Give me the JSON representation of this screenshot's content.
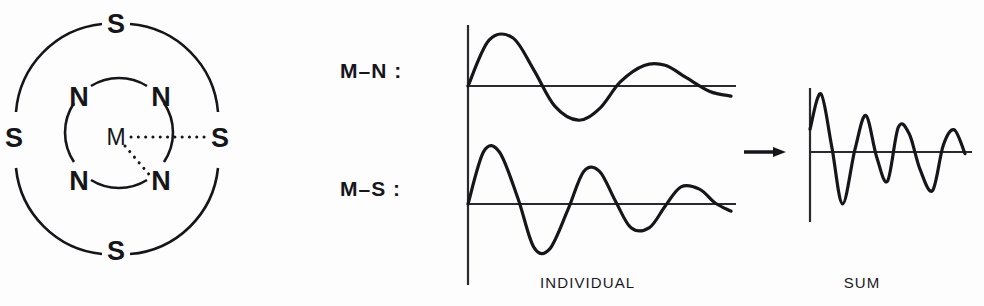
{
  "figure": {
    "background_color": "#fdfdfd",
    "ink_color": "#16161a"
  },
  "structure_diagram": {
    "name": "coordination-shell-diagram",
    "center_atom": "M",
    "inner_shell": {
      "element": "N",
      "count": 4,
      "labels": [
        "N",
        "N",
        "N",
        "N"
      ]
    },
    "outer_shell": {
      "element": "S",
      "count": 4,
      "labels": [
        "S",
        "S",
        "S",
        "S"
      ]
    },
    "bonds": [
      {
        "from": "M",
        "to": "S",
        "style": "dotted",
        "direction": "right"
      },
      {
        "from": "M",
        "to": "N",
        "style": "dotted",
        "direction": "lower-right"
      }
    ]
  },
  "wave_panel": {
    "row_labels": [
      "M–N :",
      "M–S :"
    ],
    "individual_caption": "INDIVIDUAL",
    "sum_caption": "SUM",
    "arrow_symbol": "→"
  },
  "chart_data": [
    {
      "type": "line",
      "name": "M-N",
      "title": "M–N :",
      "description": "Damped sinusoidal EXAFS contribution from the nitrogen shell",
      "frequency_cycles": 3,
      "xlabel": "",
      "ylabel": "",
      "grid": false,
      "legend": "none",
      "axis_x_px": 468,
      "baseline_y_px": 86,
      "x_start": 468,
      "x_end": 731,
      "amplitude_start": 56,
      "amplitude_end": 22,
      "x": [
        0,
        0.08,
        0.17,
        0.25,
        0.33,
        0.42,
        0.5,
        0.58,
        0.67,
        0.75,
        0.83,
        0.92,
        1.0
      ],
      "values": [
        0,
        0.86,
        0.96,
        0.34,
        -0.45,
        -0.82,
        -0.58,
        0.12,
        0.62,
        0.68,
        0.3,
        -0.22,
        -0.46
      ]
    },
    {
      "type": "line",
      "name": "M-S",
      "title": "M–S :",
      "description": "Damped sinusoidal EXAFS contribution from the sulfur shell, higher frequency",
      "frequency_cycles": 4,
      "xlabel": "",
      "ylabel": "",
      "grid": false,
      "legend": "none",
      "axis_x_px": 468,
      "baseline_y_px": 204,
      "x_start": 468,
      "x_end": 731,
      "amplitude_start": 62,
      "amplitude_end": 24,
      "x": [
        0,
        0.06,
        0.12,
        0.19,
        0.25,
        0.31,
        0.38,
        0.44,
        0.5,
        0.56,
        0.62,
        0.69,
        0.75,
        0.81,
        0.88,
        0.94,
        1.0
      ],
      "values": [
        0,
        0.88,
        0.9,
        0.1,
        -0.82,
        -0.9,
        -0.12,
        0.72,
        0.76,
        0.08,
        -0.62,
        -0.66,
        -0.06,
        0.55,
        0.52,
        0.04,
        -0.3
      ]
    },
    {
      "type": "line",
      "name": "SUM",
      "title": "SUM",
      "description": "Sum of the M-N and M-S contributions showing beat interference",
      "xlabel": "",
      "ylabel": "",
      "grid": false,
      "legend": "none",
      "axis_x_px": 810,
      "baseline_y_px": 152,
      "x_start": 810,
      "x_end": 965,
      "amplitude_start": 60,
      "amplitude_end": 34,
      "x": [
        0,
        0.07,
        0.14,
        0.21,
        0.29,
        0.36,
        0.43,
        0.5,
        0.57,
        0.64,
        0.71,
        0.79,
        0.86,
        0.93,
        1.0
      ],
      "values": [
        0.38,
        1.0,
        0.1,
        -0.95,
        0.05,
        0.72,
        -0.1,
        -0.62,
        0.55,
        0.42,
        -0.42,
        -0.98,
        0.18,
        0.62,
        -0.05
      ]
    }
  ]
}
